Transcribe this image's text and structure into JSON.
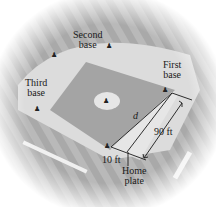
{
  "labels": {
    "second_base": [
      "Second",
      "base"
    ],
    "first_base": [
      "First",
      "base"
    ],
    "third_base": [
      "Third",
      "base"
    ],
    "home_plate": [
      "Home",
      "plate"
    ],
    "d": "d",
    "ninety_ft": "90 ft",
    "ten_ft": "10 ft"
  },
  "colors": {
    "background_field": "#9a9a9a",
    "outfield_light": "#cfcfcf",
    "infield_dirt": "#e6e6e6",
    "infield_grass": "#a8a8a8",
    "mound": "#e8e8e8",
    "lines": "#1a1a1a"
  }
}
